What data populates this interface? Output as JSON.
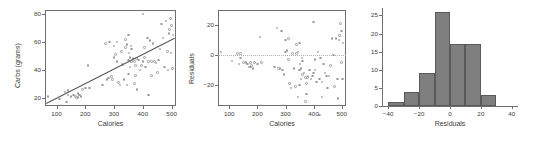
{
  "figure": {
    "title": "",
    "panel_count": 3
  },
  "panels": {
    "scatter": {
      "name": "carbs-vs-calories-scatter",
      "xlabel": "Calories",
      "ylabel": "Carbs (grams)",
      "xticks": [
        "100",
        "200",
        "300",
        "400",
        "500"
      ],
      "yticks": [
        "20",
        "40",
        "60",
        "80"
      ]
    },
    "residual": {
      "name": "residuals-vs-calories-scatter",
      "xlabel": "Calories",
      "ylabel": "Residuals",
      "xticks": [
        "100",
        "200",
        "300",
        "400",
        "500"
      ],
      "yticks": [
        "-20",
        "0",
        "20"
      ]
    },
    "histogram": {
      "name": "residual-histogram",
      "xlabel": "Residuals",
      "ylabel": "",
      "xticks": [
        "-40",
        "-20",
        "0",
        "20",
        "40"
      ],
      "yticks": [
        "0",
        "5",
        "10",
        "15",
        "20",
        "25"
      ]
    }
  },
  "colors": {
    "point_stroke": "#9a9a9a",
    "axis": "#6f6f6f",
    "bar_fill": "#7f7f7f",
    "bar_stroke": "#5a5a5a",
    "fit_line": "#555555",
    "zero_line": "#b0b0b0",
    "text": "#3a3a3a",
    "background": "#ffffff"
  },
  "chart_data": [
    {
      "type": "scatter",
      "id": "carbs-vs-calories",
      "title": "",
      "xlabel": "Calories",
      "ylabel": "Carbs (grams)",
      "xlim": [
        60,
        515
      ],
      "ylim": [
        14,
        83
      ],
      "xticks": [
        100,
        200,
        300,
        400,
        500
      ],
      "yticks": [
        20,
        40,
        60,
        80
      ],
      "grid": false,
      "legend": null,
      "fit_line": {
        "type": "linear",
        "x": [
          65,
          512
        ],
        "y": [
          16.5,
          63.5
        ]
      },
      "x": [
        70,
        110,
        130,
        135,
        140,
        140,
        150,
        160,
        165,
        170,
        175,
        175,
        180,
        185,
        190,
        200,
        210,
        215,
        260,
        270,
        275,
        280,
        285,
        290,
        295,
        300,
        300,
        305,
        310,
        310,
        315,
        320,
        325,
        330,
        335,
        340,
        340,
        345,
        345,
        350,
        350,
        350,
        352,
        355,
        355,
        358,
        360,
        360,
        365,
        370,
        370,
        375,
        375,
        378,
        380,
        385,
        390,
        395,
        400,
        400,
        405,
        405,
        410,
        415,
        420,
        420,
        425,
        430,
        430,
        435,
        440,
        445,
        450,
        455,
        460,
        465,
        470,
        475,
        480,
        485,
        487,
        490,
        492,
        495,
        498,
        500,
        502,
        505
      ],
      "y": [
        21,
        19,
        24,
        17,
        22,
        25,
        21,
        22,
        21,
        20,
        20,
        23,
        22,
        21,
        26,
        27,
        43,
        27,
        29,
        59,
        33,
        34,
        60,
        35,
        33,
        49,
        57,
        51,
        46,
        60,
        31,
        29,
        53,
        44,
        33,
        62,
        56,
        29,
        58,
        37,
        47,
        65,
        52,
        42,
        49,
        57,
        55,
        46,
        48,
        30,
        46,
        36,
        43,
        48,
        26,
        47,
        40,
        43,
        80,
        46,
        49,
        56,
        42,
        63,
        46,
        22,
        61,
        36,
        46,
        59,
        46,
        45,
        38,
        47,
        55,
        73,
        63,
        42,
        75,
        53,
        40,
        66,
        69,
        77,
        52,
        72,
        41,
        65
      ]
    },
    {
      "type": "scatter",
      "id": "residuals-vs-calories",
      "title": "",
      "xlabel": "Calories",
      "ylabel": "Residuals",
      "xlim": [
        60,
        515
      ],
      "ylim": [
        -34,
        30
      ],
      "xticks": [
        100,
        200,
        300,
        400,
        500
      ],
      "yticks": [
        -20,
        0,
        20
      ],
      "grid": false,
      "legend": null,
      "reference_line": {
        "y": 0,
        "style": "dotted"
      },
      "x": [
        70,
        110,
        130,
        135,
        140,
        140,
        150,
        160,
        165,
        170,
        175,
        175,
        180,
        185,
        190,
        200,
        210,
        215,
        260,
        270,
        275,
        280,
        285,
        290,
        295,
        300,
        300,
        305,
        310,
        310,
        315,
        320,
        325,
        330,
        335,
        340,
        340,
        345,
        345,
        350,
        350,
        350,
        352,
        355,
        355,
        358,
        360,
        360,
        365,
        370,
        370,
        375,
        375,
        378,
        380,
        385,
        390,
        395,
        400,
        400,
        405,
        405,
        410,
        415,
        420,
        420,
        425,
        430,
        430,
        435,
        440,
        445,
        450,
        455,
        460,
        465,
        470,
        475,
        480,
        485,
        487,
        490,
        492,
        495,
        498,
        500,
        502,
        505
      ],
      "y": [
        2,
        -4,
        1,
        -6,
        -2,
        1,
        -5,
        -5,
        -6,
        -8,
        -8,
        -5,
        -7,
        -9,
        -5,
        -6,
        12,
        -5,
        -8,
        18,
        -9,
        -9,
        16,
        -10,
        -13,
        2,
        10,
        3,
        -3,
        11,
        -19,
        -22,
        1,
        -9,
        -21,
        7,
        1,
        -28,
        2,
        -20,
        -10,
        8,
        -6,
        -16,
        -9,
        -2,
        -4,
        -13,
        -12,
        -31,
        -15,
        -26,
        -19,
        -15,
        -14,
        -10,
        -16,
        -14,
        22,
        -12,
        -10,
        -3,
        -18,
        2,
        -16,
        -40,
        -2,
        -28,
        -18,
        -6,
        -12,
        -14,
        -22,
        -14,
        -7,
        11,
        0,
        -21,
        11,
        -16,
        -29,
        10,
        13,
        21,
        -5,
        16,
        -16,
        8
      ]
    },
    {
      "type": "bar",
      "subtype": "histogram",
      "id": "residual-histogram",
      "title": "",
      "xlabel": "Residuals",
      "ylabel": "",
      "xlim": [
        -44,
        44
      ],
      "ylim": [
        0,
        26.5
      ],
      "xticks": [
        -40,
        -20,
        0,
        20,
        40
      ],
      "yticks": [
        0,
        5,
        10,
        15,
        20,
        25
      ],
      "grid": false,
      "legend": null,
      "bin_edges": [
        -40,
        -30,
        -20,
        -10,
        0,
        10,
        20,
        30
      ],
      "categories": [
        "-40 to -30",
        "-30 to -20",
        "-20 to -10",
        "-10 to 0",
        "0 to 10",
        "10 to 20",
        "20 to 30"
      ],
      "values": [
        1,
        4,
        9,
        26,
        17,
        17,
        3
      ]
    }
  ]
}
